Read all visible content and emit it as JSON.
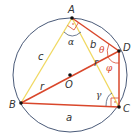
{
  "diagram": {
    "type": "inscribed-quadrilateral-geometry",
    "colors": {
      "circle": "#4a5a78",
      "red_lines": "#d9472b",
      "yellow_lines": "#f0d860",
      "points": "#111111",
      "angle_red": "#d9472b",
      "text": "#333333"
    },
    "points": {
      "A": {
        "label": "A"
      },
      "B": {
        "label": "B"
      },
      "C": {
        "label": "C"
      },
      "D": {
        "label": "D"
      },
      "O": {
        "label": "O"
      }
    },
    "sides": {
      "a": "a",
      "b": "b",
      "c": "c",
      "r1": "r",
      "r2": "r"
    },
    "angles": {
      "alpha": "α",
      "gamma": "γ",
      "theta": "θ",
      "phi": "φ"
    },
    "right_angle_marker": "·"
  }
}
